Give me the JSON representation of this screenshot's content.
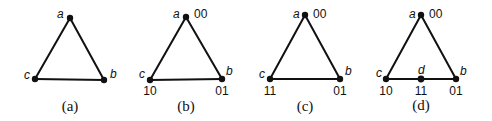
{
  "panels": [
    {
      "caption": "(a)",
      "vertices": [
        {
          "name": "a",
          "code": ""
        },
        {
          "name": "b",
          "code": ""
        },
        {
          "name": "c",
          "code": ""
        }
      ]
    },
    {
      "caption": "(b)",
      "vertices": [
        {
          "name": "a",
          "code": "00"
        },
        {
          "name": "b",
          "code": "01"
        },
        {
          "name": "c",
          "code": "10"
        }
      ]
    },
    {
      "caption": "(c)",
      "vertices": [
        {
          "name": "a",
          "code": "00"
        },
        {
          "name": "b",
          "code": "01"
        },
        {
          "name": "c",
          "code": "11"
        }
      ]
    },
    {
      "caption": "(d)",
      "vertices": [
        {
          "name": "a",
          "code": "00"
        },
        {
          "name": "b",
          "code": "01"
        },
        {
          "name": "c",
          "code": "10"
        },
        {
          "name": "d",
          "code": "11"
        }
      ]
    }
  ]
}
